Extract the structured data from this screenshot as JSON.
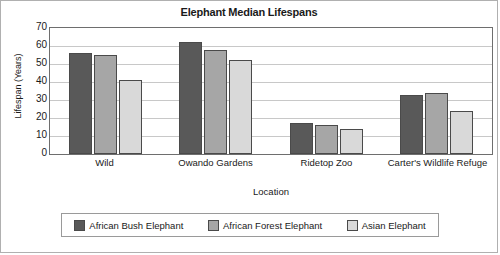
{
  "chart_data": {
    "type": "bar",
    "title": "Elephant Median Lifespans",
    "xlabel": "Location",
    "ylabel": "Lifespan (Years)",
    "categories": [
      "Wild",
      "Owando Gardens",
      "Ridetop Zoo",
      "Carter's Wildlife Refuge"
    ],
    "series": [
      {
        "name": "African Bush Elephant",
        "color": "#595959",
        "values": [
          56,
          62,
          17,
          33
        ]
      },
      {
        "name": "African Forest Elephant",
        "color": "#a6a6a6",
        "values": [
          55,
          58,
          16,
          34
        ]
      },
      {
        "name": "Asian Elephant",
        "color": "#d9d9d9",
        "values": [
          41,
          52,
          14,
          24
        ]
      }
    ],
    "ylim": [
      0,
      70
    ],
    "yticks": [
      70,
      60,
      50,
      40,
      30,
      20,
      10,
      0
    ],
    "grid": true,
    "legend_position": "bottom"
  }
}
